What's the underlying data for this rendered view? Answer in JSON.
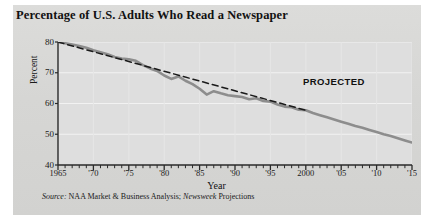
{
  "chart_data": {
    "type": "line",
    "title": "Percentage of U.S. Adults Who Read a Newspaper",
    "xlabel": "Year",
    "ylabel": "Percent",
    "xlim": [
      1965,
      2015
    ],
    "ylim": [
      40,
      80
    ],
    "ytick_values": [
      40,
      50,
      60,
      70,
      80
    ],
    "ytick_labels": [
      "40",
      "50",
      "60",
      "70",
      "80"
    ],
    "xtick_values": [
      1965,
      1970,
      1975,
      1980,
      1985,
      1990,
      1995,
      2000,
      2005,
      2010,
      2015
    ],
    "xtick_labels": [
      "1965",
      "'70",
      "'75",
      "'80",
      "'85",
      "'90",
      "'95",
      "2000",
      "'05",
      "'10",
      "'15"
    ],
    "minor_xticks_every": 1,
    "grid": "horizontal",
    "legend": "none",
    "annotations": [
      {
        "text": "PROJECTED",
        "x": 2000,
        "y": 69
      }
    ],
    "series": [
      {
        "name": "Percentage of U.S. adults who read a newspaper",
        "style": "solid",
        "color": "#8d8d8d",
        "x": [
          1965,
          1966,
          1967,
          1968,
          1969,
          1970,
          1971,
          1972,
          1973,
          1974,
          1975,
          1976,
          1977,
          1978,
          1979,
          1980,
          1981,
          1982,
          1983,
          1984,
          1985,
          1986,
          1987,
          1988,
          1989,
          1990,
          1991,
          1992,
          1993,
          1994,
          1995,
          1996,
          1997,
          1998,
          1999,
          2000,
          2001,
          2002,
          2003,
          2004,
          2005,
          2006,
          2007,
          2008,
          2009,
          2010,
          2011,
          2012,
          2013,
          2014,
          2015
        ],
        "y": [
          80.0,
          79.6,
          79.2,
          78.7,
          78.1,
          77.3,
          76.7,
          76.0,
          75.1,
          74.6,
          74.4,
          73.9,
          72.5,
          71.4,
          70.6,
          69.1,
          68.0,
          68.8,
          67.4,
          66.3,
          64.8,
          62.9,
          64.0,
          63.3,
          62.7,
          62.4,
          62.1,
          61.4,
          61.7,
          60.8,
          60.6,
          59.7,
          59.0,
          58.8,
          58.0,
          57.8,
          56.9,
          56.2,
          55.5,
          54.8,
          54.1,
          53.4,
          52.7,
          52.1,
          51.4,
          50.7,
          50.0,
          49.4,
          48.7,
          48.0,
          47.3
        ]
      },
      {
        "name": "Trend line",
        "style": "dashed",
        "color": "#1a1a1a",
        "x": [
          1965,
          2000
        ],
        "y": [
          80.0,
          57.8
        ]
      }
    ],
    "projection_starts": 2000,
    "projection_note": "Values after 2000 are Newsweek projections"
  },
  "source": {
    "prefix": "Source:",
    "body": " NAA Market & Business Analysis; ",
    "italic_name": "Newsweek",
    "suffix": " Projections"
  },
  "colors": {
    "panel": "#d8d8d6",
    "plot_background": "#dedede",
    "axis": "#2a2a2a",
    "gridline": "#f2f2f2",
    "data_line": "#8d8d8d",
    "trend_line": "#1a1a1a",
    "page": "#ffffff"
  }
}
